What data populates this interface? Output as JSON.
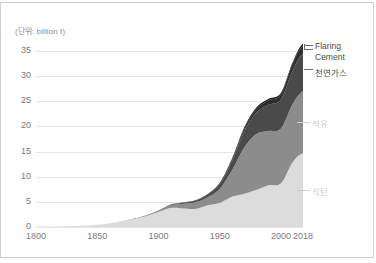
{
  "unit_label": "(단위: billion t)",
  "labels": {
    "flaring": "Flaring",
    "cement": "Cement",
    "gas": "천연가스",
    "oil": "석유",
    "coal": "석탄"
  },
  "colors": {
    "coal": "#dcdcdc",
    "oil": "#8c8c8c",
    "gas": "#4a4a4a",
    "cement": "#2e2e2e",
    "flaring": "#1b1b1b",
    "gridline": "#e6e6e6",
    "axis_text": "#7a7a7a",
    "border": "#cfcfcf",
    "callout_text": "#4a4a4a",
    "callout_inside_text": "#cdcdcd"
  },
  "chart_data": {
    "type": "area",
    "stacked": true,
    "title": "",
    "subtitle": "",
    "xlabel": "",
    "ylabel": "",
    "unit": "billion t",
    "grid": true,
    "legend_position": "right-inline",
    "xlim": [
      1800,
      2018
    ],
    "ylim": [
      0,
      37
    ],
    "xticks": [
      1800,
      1850,
      1900,
      1950,
      2000,
      2018
    ],
    "yticks": [
      0,
      5,
      10,
      15,
      20,
      25,
      30,
      35
    ],
    "x": [
      1800,
      1810,
      1820,
      1830,
      1840,
      1850,
      1860,
      1870,
      1880,
      1890,
      1900,
      1910,
      1920,
      1930,
      1940,
      1950,
      1960,
      1970,
      1980,
      1990,
      2000,
      2010,
      2018
    ],
    "series": [
      {
        "name": "석탄",
        "key": "coal",
        "values": [
          0.05,
          0.08,
          0.12,
          0.18,
          0.28,
          0.45,
          0.7,
          1.1,
          1.6,
          2.2,
          3.0,
          3.8,
          3.7,
          3.6,
          4.3,
          4.8,
          6.0,
          6.6,
          7.4,
          8.3,
          8.7,
          13.0,
          14.7
        ]
      },
      {
        "name": "석유",
        "key": "oil",
        "values": [
          0,
          0,
          0,
          0,
          0,
          0,
          0.01,
          0.03,
          0.07,
          0.12,
          0.2,
          0.5,
          0.9,
          1.3,
          1.6,
          2.8,
          5.3,
          9.2,
          11.1,
          10.8,
          10.9,
          11.6,
          12.3
        ]
      },
      {
        "name": "천연가스",
        "key": "gas",
        "values": [
          0,
          0,
          0,
          0,
          0,
          0,
          0,
          0,
          0.01,
          0.02,
          0.05,
          0.1,
          0.2,
          0.3,
          0.5,
          0.9,
          1.8,
          3.2,
          4.3,
          5.2,
          5.8,
          6.7,
          7.5
        ]
      },
      {
        "name": "Cement",
        "key": "cement",
        "values": [
          0,
          0,
          0,
          0,
          0,
          0,
          0,
          0,
          0,
          0.01,
          0.02,
          0.04,
          0.06,
          0.08,
          0.1,
          0.2,
          0.3,
          0.5,
          0.7,
          0.9,
          1.0,
          1.4,
          1.6
        ]
      },
      {
        "name": "Flaring",
        "key": "flaring",
        "values": [
          0,
          0,
          0,
          0,
          0,
          0,
          0,
          0,
          0,
          0,
          0.01,
          0.02,
          0.03,
          0.04,
          0.05,
          0.1,
          0.2,
          0.3,
          0.3,
          0.3,
          0.3,
          0.3,
          0.4
        ]
      }
    ],
    "totals_note": "Peak stacked total at 2018 is about 36.5 billion t"
  },
  "callouts": [
    {
      "key": "flaring",
      "label": "Flaring",
      "style": "outside"
    },
    {
      "key": "cement",
      "label": "Cement",
      "style": "outside"
    },
    {
      "key": "gas",
      "label": "천연가스",
      "style": "outside"
    },
    {
      "key": "oil",
      "label": "석유",
      "style": "inside"
    },
    {
      "key": "coal",
      "label": "석탄",
      "style": "inside"
    }
  ]
}
